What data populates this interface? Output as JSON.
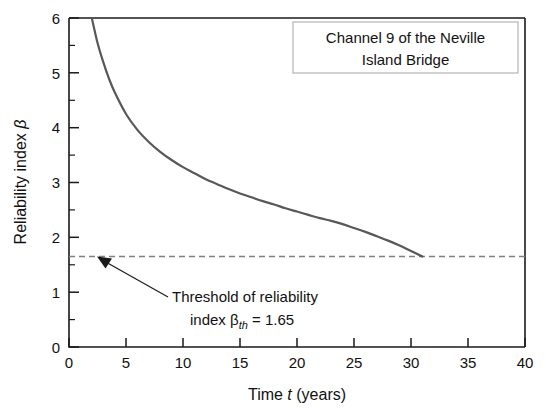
{
  "chart_data": {
    "type": "line",
    "title": "",
    "annotation_box": {
      "line1": "Channel 9 of the Neville",
      "line2": "Island Bridge"
    },
    "xlabel_parts": {
      "pre": "Time ",
      "symbol": "t",
      "post": " (years)"
    },
    "xlabel": "Time t (years)",
    "ylabel_parts": {
      "pre": "Reliability index ",
      "symbol": "β"
    },
    "ylabel": "Reliability index β",
    "xlim": [
      0,
      40
    ],
    "ylim": [
      0,
      6
    ],
    "xticks": [
      0,
      5,
      10,
      15,
      20,
      25,
      30,
      35,
      40
    ],
    "xtick_labels": [
      "0",
      "5",
      "10",
      "15",
      "20",
      "25",
      "30",
      "35",
      "40"
    ],
    "yticks": [
      0,
      1,
      2,
      3,
      4,
      5,
      6
    ],
    "ytick_labels": [
      "0",
      "1",
      "2",
      "3",
      "4",
      "5",
      "6"
    ],
    "y_minor_ticks": [
      0.5,
      1.5,
      2.5,
      3.5,
      4.5,
      5.5
    ],
    "grid": false,
    "legend": "none",
    "series": [
      {
        "name": "Reliability index β(t)",
        "color": "#585858",
        "style": "solid",
        "x": [
          2.0,
          2.5,
          3.0,
          3.5,
          4.0,
          5.0,
          6.0,
          7.0,
          8.0,
          9.0,
          10.0,
          11.0,
          12.0,
          13.0,
          14.0,
          15.0,
          16.0,
          17.0,
          18.0,
          19.0,
          20.0,
          21.0,
          22.0,
          23.0,
          24.0,
          25.0,
          26.0,
          27.0,
          28.0,
          29.0,
          30.0,
          31.0
        ],
        "y": [
          6.0,
          5.55,
          5.2,
          4.9,
          4.65,
          4.25,
          3.96,
          3.74,
          3.56,
          3.41,
          3.28,
          3.17,
          3.06,
          2.97,
          2.88,
          2.8,
          2.73,
          2.66,
          2.6,
          2.53,
          2.47,
          2.41,
          2.35,
          2.3,
          2.24,
          2.17,
          2.1,
          2.02,
          1.94,
          1.85,
          1.75,
          1.65
        ]
      }
    ],
    "threshold": {
      "label_line1": "Threshold of reliability",
      "label_line2_pre": "index ",
      "label_line2_symbol": "β",
      "label_line2_sub": "th",
      "label_line2_post": " = 1.65",
      "label": "Threshold of reliability index βth = 1.65",
      "value": 1.65,
      "color": "#808080",
      "style": "dashed"
    },
    "intersection": {
      "x": 31,
      "y": 1.65
    }
  }
}
